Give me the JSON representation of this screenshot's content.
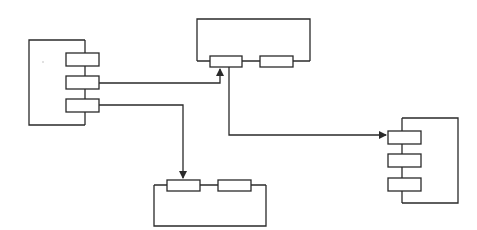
{
  "diagram": {
    "type": "block-connection-diagram",
    "stroke_color": "#2a2a2a",
    "background": "#ffffff",
    "containers": [
      {
        "id": "left",
        "points": "85,40 29,40 29,125 85,125",
        "ports": [
          {
            "x": 66,
            "y": 53,
            "w": 33,
            "h": 13
          },
          {
            "x": 66,
            "y": 76,
            "w": 33,
            "h": 13
          },
          {
            "x": 66,
            "y": 99,
            "w": 33,
            "h": 13
          }
        ],
        "spine": {
          "x1": 85,
          "y1": 40,
          "x2": 85,
          "y2": 125
        }
      },
      {
        "id": "top",
        "points": "197,61 197,19 310,19 310,61",
        "ports": [
          {
            "x": 210,
            "y": 56,
            "w": 32,
            "h": 11
          },
          {
            "x": 260,
            "y": 56,
            "w": 33,
            "h": 11
          }
        ],
        "spine": {
          "x1": 197,
          "y1": 61,
          "x2": 310,
          "y2": 61
        }
      },
      {
        "id": "bottom",
        "points": "154,185 154,226 266,226 266,185",
        "ports": [
          {
            "x": 167,
            "y": 180,
            "w": 33,
            "h": 11
          },
          {
            "x": 218,
            "y": 180,
            "w": 33,
            "h": 11
          }
        ],
        "spine": {
          "x1": 154,
          "y1": 185,
          "x2": 266,
          "y2": 185
        }
      },
      {
        "id": "right",
        "points": "402,118 458,118 458,203 402,203",
        "ports": [
          {
            "x": 388,
            "y": 131,
            "w": 33,
            "h": 13
          },
          {
            "x": 388,
            "y": 154,
            "w": 33,
            "h": 13
          },
          {
            "x": 388,
            "y": 178,
            "w": 33,
            "h": 13
          }
        ],
        "spine": {
          "x1": 402,
          "y1": 118,
          "x2": 402,
          "y2": 203
        }
      }
    ],
    "connections": [
      {
        "from": "left.port2",
        "to": "top.port1",
        "path": "99,83 220,83 220,69",
        "arrow": "up"
      },
      {
        "from": "left.port3",
        "to": "bottom.port1",
        "path": "99,105 183,105 183,178",
        "arrow": "down"
      },
      {
        "from": "top.port1",
        "to": "right.port1",
        "path": "229,67 229,135 386,135",
        "arrow": "right"
      }
    ]
  }
}
